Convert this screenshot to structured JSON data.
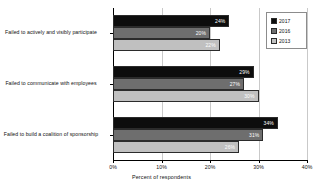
{
  "chart_data": {
    "type": "bar",
    "orientation": "horizontal",
    "title": "",
    "xlabel": "Percent of respondents",
    "ylabel": "",
    "xlim": [
      0,
      40
    ],
    "xticks": [
      "0%",
      "10%",
      "20%",
      "30%",
      "40%"
    ],
    "xtick_values": [
      0,
      10,
      20,
      30,
      40
    ],
    "grid": true,
    "legend_position": "top-right",
    "categories": [
      "Failed to actively and visibly participate",
      "Failed to communicate with employees",
      "Failed to build a coalition of sponsorship"
    ],
    "series": [
      {
        "name": "2017",
        "color": "#0d0d0d",
        "values": [
          24,
          29,
          34
        ],
        "labels": [
          "24%",
          "29%",
          "34%"
        ]
      },
      {
        "name": "2016",
        "color": "#6e6e6e",
        "values": [
          20,
          27,
          31
        ],
        "labels": [
          "20%",
          "27%",
          "31%"
        ]
      },
      {
        "name": "2013",
        "color": "#c0c0c0",
        "values": [
          22,
          30,
          26
        ],
        "labels": [
          "22%",
          "30%",
          "26%"
        ]
      }
    ]
  },
  "legend": {
    "items": [
      {
        "label": "2017"
      },
      {
        "label": "2016"
      },
      {
        "label": "2013"
      }
    ]
  },
  "axis": {
    "x_title": "Percent of respondents"
  }
}
